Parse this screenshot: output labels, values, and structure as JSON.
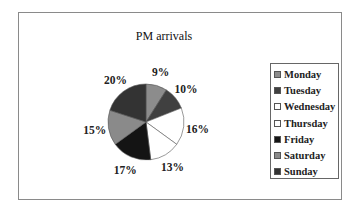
{
  "chart_data": {
    "type": "pie",
    "title": "PM arrivals",
    "categories": [
      "Monday",
      "Tuesday",
      "Wednesday",
      "Thursday",
      "Friday",
      "Saturday",
      "Sunday"
    ],
    "values": [
      9,
      10,
      16,
      13,
      17,
      15,
      20
    ],
    "labels": [
      "9%",
      "10%",
      "16%",
      "13%",
      "17%",
      "15%",
      "20%"
    ],
    "colors": [
      "#8c8c8c",
      "#404040",
      "#ffffff",
      "#ffffff",
      "#141414",
      "#8a8a8a",
      "#333333"
    ],
    "start_angle": "12 o'clock",
    "direction": "clockwise",
    "legend_position": "right"
  }
}
